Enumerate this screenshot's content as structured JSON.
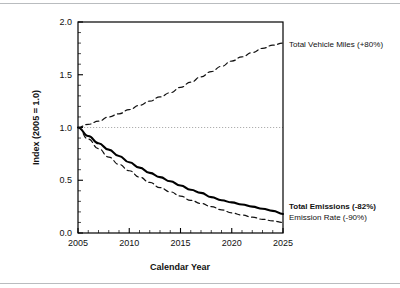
{
  "figure": {
    "background_color": "#ffffff",
    "frame_color": "#b9bcbf",
    "plot_border_color": "#000000"
  },
  "chart_data": {
    "type": "line",
    "title": "",
    "xlabel": "Calendar Year",
    "ylabel": "Index (2005 = 1.0)",
    "xlim": [
      2005,
      2025
    ],
    "ylim": [
      0.0,
      2.0
    ],
    "xticks": [
      2005,
      2010,
      2015,
      2020,
      2025
    ],
    "xtick_labels": [
      "2005",
      "2010",
      "2015",
      "2020",
      "2025"
    ],
    "yticks": [
      0.0,
      0.5,
      1.0,
      1.5,
      2.0
    ],
    "ytick_labels": [
      "0.0",
      "0.5",
      "1.0",
      "1.5",
      "2.0"
    ],
    "x_minor_tick_step": 1,
    "y_minor_tick_step": 0.1,
    "grid": false,
    "legend_position": "inline-right",
    "reference_line": {
      "name": "baseline-1.0",
      "y": 1.0,
      "style": "dotted",
      "color": "#9a9a9a"
    },
    "x": [
      2005,
      2006,
      2007,
      2008,
      2009,
      2010,
      2011,
      2012,
      2013,
      2014,
      2015,
      2016,
      2017,
      2018,
      2019,
      2020,
      2021,
      2022,
      2023,
      2024,
      2025
    ],
    "series": [
      {
        "name": "Total Vehicle Miles",
        "label": "Total Vehicle Miles (+80%)",
        "change_pct": 80,
        "style": "dashed",
        "weight": "normal",
        "color": "#111111",
        "values": [
          1.0,
          1.03,
          1.06,
          1.1,
          1.13,
          1.17,
          1.21,
          1.25,
          1.29,
          1.33,
          1.38,
          1.43,
          1.48,
          1.53,
          1.58,
          1.63,
          1.67,
          1.71,
          1.75,
          1.78,
          1.8
        ]
      },
      {
        "name": "Total Emissions",
        "label": "Total Emissions (-82%)",
        "change_pct": -82,
        "style": "solid",
        "weight": "bold",
        "color": "#000000",
        "values": [
          1.0,
          0.92,
          0.85,
          0.79,
          0.73,
          0.67,
          0.62,
          0.57,
          0.53,
          0.49,
          0.45,
          0.41,
          0.38,
          0.34,
          0.31,
          0.29,
          0.27,
          0.25,
          0.23,
          0.21,
          0.18
        ]
      },
      {
        "name": "Emission Rate",
        "label": "Emission Rate (-90%)",
        "change_pct": -90,
        "style": "dashed",
        "weight": "normal",
        "color": "#111111",
        "values": [
          1.0,
          0.89,
          0.8,
          0.72,
          0.65,
          0.59,
          0.53,
          0.48,
          0.43,
          0.39,
          0.35,
          0.31,
          0.28,
          0.25,
          0.22,
          0.19,
          0.17,
          0.15,
          0.13,
          0.115,
          0.1
        ]
      }
    ]
  }
}
